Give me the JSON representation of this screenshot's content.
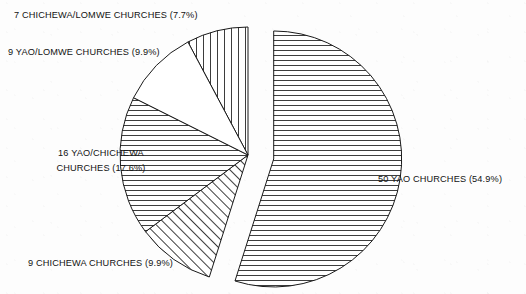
{
  "figure": {
    "background_color": "#fdfdfd",
    "ink_color": "#121212"
  },
  "chart_data": {
    "type": "pie",
    "title": "",
    "subtitle": "",
    "xlabel": "",
    "ylabel": "",
    "legend_position": "none",
    "grid": false,
    "total_count": 91,
    "value_unit": "churches",
    "categories": [
      "7 CHICHEWA/LOMWE CHURCHES",
      "50 YAO CHURCHES",
      "9 CHICHEWA CHURCHES",
      "16 YAO/CHICHEWA CHURCHES",
      "9 YAO/LOMWE CHURCHES"
    ],
    "values": [
      7,
      50,
      9,
      16,
      9
    ],
    "percentages": [
      7.7,
      54.9,
      9.9,
      17.6,
      9.9
    ],
    "slices": [
      {
        "id": "chichewa-lomwe",
        "name": "CHICHEWA/LOMWE",
        "count": 7,
        "percent": 7.7,
        "label": "7 CHICHEWA/LOMWE CHURCHES (7.7%)",
        "hatch": "vertical",
        "exploded": false,
        "start_deg": -28.0,
        "end_deg": 0.0
      },
      {
        "id": "yao",
        "name": "YAO",
        "count": 50,
        "percent": 54.9,
        "label": "50 YAO CHURCHES (54.9%)",
        "hatch": "horizontal",
        "exploded": true,
        "start_deg": 0.0,
        "end_deg": 197.6
      },
      {
        "id": "chichewa",
        "name": "CHICHEWA",
        "count": 9,
        "percent": 9.9,
        "label": "9 CHICHEWA CHURCHES (9.9%)",
        "hatch": "diagonal",
        "exploded": false,
        "start_deg": 197.6,
        "end_deg": 233.2
      },
      {
        "id": "yao-chichewa",
        "name": "YAO/CHICHEWA",
        "count": 16,
        "percent": 17.6,
        "label_line1": "16 YAO/CHICHEWA",
        "label_line2": "CHURCHES  (17.6%)",
        "hatch": "horizontal",
        "exploded": false,
        "start_deg": 233.2,
        "end_deg": 296.6
      },
      {
        "id": "yao-lomwe",
        "name": "YAO/LOMWE",
        "count": 9,
        "percent": 9.9,
        "label": "9 YAO/LOMWE CHURCHES (9.9%)",
        "hatch": "none",
        "exploded": false,
        "start_deg": 296.6,
        "end_deg": 332.0
      }
    ]
  },
  "labels": {
    "chichewa_lomwe": "7 CHICHEWA/LOMWE CHURCHES (7.7%)",
    "yao_lomwe": "9 YAO/LOMWE CHURCHES (9.9%)",
    "yao_chichewa_line1": "16 YAO/CHICHEWA",
    "yao_chichewa_line2": "CHURCHES  (17.6%)",
    "chichewa": "9 CHICHEWA CHURCHES (9.9%)",
    "yao": "50 YAO CHURCHES (54.9%)"
  }
}
